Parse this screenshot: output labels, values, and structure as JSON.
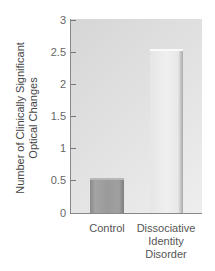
{
  "chart_data": {
    "type": "bar",
    "title": "",
    "xlabel": "",
    "ylabel": "Number of Clinically Significant Optical Changes",
    "ylabel_lines": [
      "Number of Clinically Significant",
      "Optical Changes"
    ],
    "categories": [
      "Control",
      "Dissociative Identity Disorder"
    ],
    "category_label_lines": [
      [
        "Control"
      ],
      [
        "Dissociative",
        "Identity",
        "Disorder"
      ]
    ],
    "values": [
      0.54,
      2.55
    ],
    "ylim": [
      0,
      3
    ],
    "yticks": [
      0,
      0.5,
      1,
      1.5,
      2,
      2.5,
      3
    ],
    "ytick_labels": [
      "0",
      "0.5",
      "1",
      "1.5",
      "2",
      "2.5",
      "3"
    ],
    "grid": false,
    "legend": null,
    "colors": {
      "control": "#9a9a9a",
      "dissociative_identity_disorder": "#ececec",
      "plot_background": "#e0e0e0"
    }
  }
}
